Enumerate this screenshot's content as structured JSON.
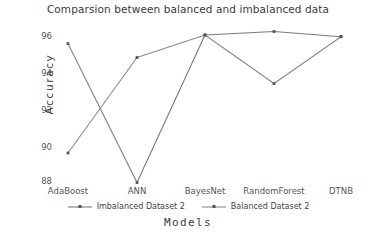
{
  "chart_data": {
    "type": "line",
    "title": "Comparsion between balanced and imbalanced data",
    "xlabel": "Models",
    "ylabel": "Accuracy",
    "categories": [
      "AdaBoost",
      "ANN",
      "BayesNet",
      "RandomForest",
      "DTNB"
    ],
    "series": [
      {
        "name": "Imbalanced Dataset 2",
        "values": [
          96.0,
          88.0,
          96.5,
          96.7,
          96.4
        ],
        "color": "#7a7a7a"
      },
      {
        "name": "Balanced Dataset 2",
        "values": [
          89.7,
          95.2,
          96.5,
          93.7,
          96.4
        ],
        "color": "#8a8a8a"
      }
    ],
    "ylim": [
      87.8,
      96.9
    ],
    "yticks": [
      88,
      90,
      92,
      94,
      96
    ],
    "ytick_labels": [
      "88",
      "90",
      "92",
      "94",
      "96"
    ],
    "grid": false,
    "legend_position": "bottom",
    "marker": "point"
  }
}
